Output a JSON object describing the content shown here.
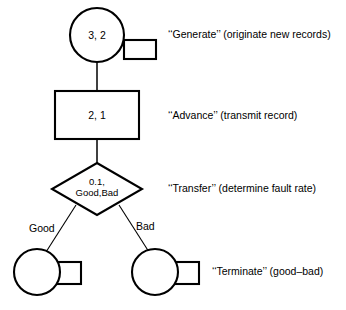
{
  "diagram": {
    "type": "flowchart",
    "title": "",
    "nodes": [
      {
        "id": "generate",
        "shape": "circle-with-tab",
        "value": "3, 2",
        "label": "‘‘Generate’’ (originate new records)"
      },
      {
        "id": "advance",
        "shape": "rectangle",
        "value": "2, 1",
        "label": "‘‘Advance’’ (transmit record)"
      },
      {
        "id": "transfer",
        "shape": "diamond",
        "value_line1": "0.1,",
        "value_line2": "Good,Bad",
        "label": "‘‘Transfer’’ (determine fault rate)"
      },
      {
        "id": "terminate-good",
        "shape": "circle-with-tab",
        "value": "",
        "label": ""
      },
      {
        "id": "terminate-bad",
        "shape": "circle-with-tab",
        "value": "",
        "label": "‘‘Terminate’’ (good–bad)"
      }
    ],
    "edges": [
      {
        "id": "generate-to-advance",
        "from": "generate",
        "to": "advance",
        "label": ""
      },
      {
        "id": "advance-to-transfer",
        "from": "advance",
        "to": "transfer",
        "label": ""
      },
      {
        "id": "transfer-to-good",
        "from": "transfer",
        "to": "terminate-good",
        "label": "Good"
      },
      {
        "id": "transfer-to-bad",
        "from": "transfer",
        "to": "terminate-bad",
        "label": "Bad"
      }
    ],
    "colors": {
      "stroke": "#000000",
      "fill": "#ffffff",
      "text": "#000000",
      "background": "#ffffff"
    }
  }
}
